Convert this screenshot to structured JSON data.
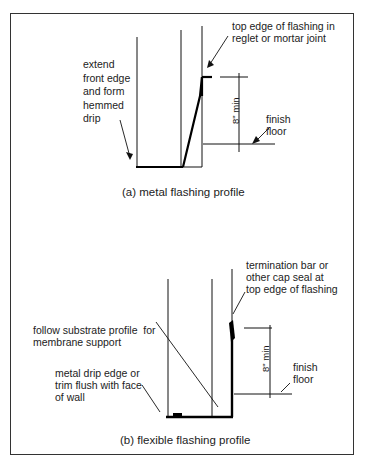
{
  "figure_a": {
    "caption": "(a) metal flashing profile",
    "labels": {
      "top_edge": "top edge of flashing in\nreglet or mortar joint",
      "front_edge": "extend\nfront edge\nand form\nhemmed\ndrip",
      "finish_floor": "finish\nfloor",
      "dimension": "8\" min"
    }
  },
  "figure_b": {
    "caption": "(b) flexible flashing profile",
    "labels": {
      "termination": "termination bar or\nother cap seal at\ntop edge of flashing",
      "substrate": "follow substrate profile  for\nmembrane support",
      "drip_edge": "metal drip edge or\ntrim flush with face\nof wall",
      "finish_floor": "finish\nfloor",
      "dimension": "8\" min"
    }
  }
}
